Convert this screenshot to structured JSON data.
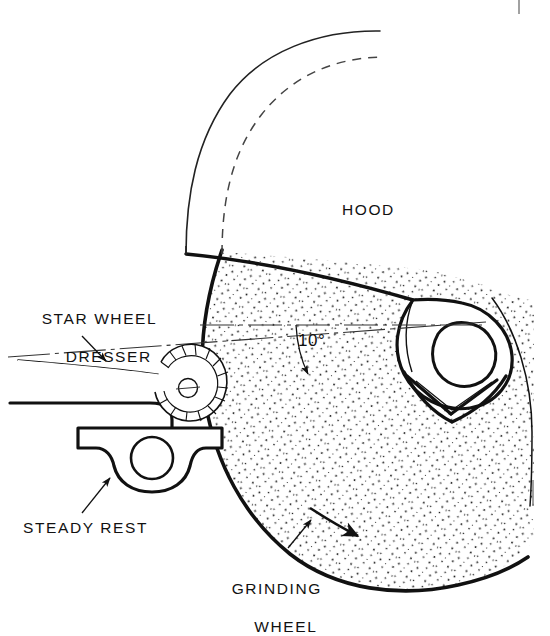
{
  "figure": {
    "background": "#ffffff",
    "ink": "#111111",
    "stipple_color": "#222222"
  },
  "labels": {
    "hood": "HOOD",
    "star_wheel_dresser_line1": "STAR WHEEL",
    "star_wheel_dresser_line2": "DRESSER",
    "steady_rest": "STEADY REST",
    "grinding_wheel_line1": "GRINDING",
    "grinding_wheel_line2": "WHEEL",
    "angle": "10°"
  },
  "annotations": {
    "angle_value": "10",
    "angle_unit": "°",
    "angle_between": "horizontal centerline and dresser centerline",
    "rotation_arrow": "wheel rotation direction"
  },
  "parts": [
    {
      "name": "hood",
      "description": "curved guard band above wheel, outer solid arc and inner dashed arc"
    },
    {
      "name": "grinding-wheel",
      "description": "large stippled abrasive wheel body"
    },
    {
      "name": "star-wheel-dresser",
      "description": "toothed star wheel on tapered arm"
    },
    {
      "name": "steady-rest",
      "description": "V-block support with bore"
    },
    {
      "name": "work-nose",
      "description": "nested arcs at right of wheel"
    }
  ],
  "page_marks": {
    "top_rule": true,
    "bottom_rule": true,
    "corner_text": ""
  }
}
